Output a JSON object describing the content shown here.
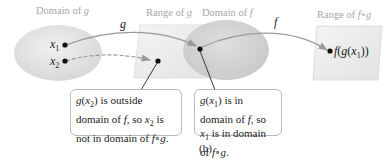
{
  "labels": {
    "domain_g": "Domain of g",
    "range_g": "Range of g",
    "domain_f": "Domain of f",
    "range_fg": "Range of f∘g"
  },
  "functions": {
    "g": "g",
    "f": "f"
  },
  "points": {
    "x1": "x1",
    "x2": "x2",
    "fgx1": "f(g(x1))"
  },
  "callouts": [
    {
      "text": "g(x2) is outside domain of f, so x2 is not in domain of f∘g."
    },
    {
      "text": "g(x1) is in domain of f, so x1 is in domain of f∘g."
    }
  ],
  "caption": "(b)",
  "colors": {
    "ellipse_fill": "#e3e3e3",
    "domain_f_fill": "#d0d0d0",
    "range_fill": "#eeeeee",
    "arrow": "#9a9a9a",
    "label_gray": "#a8a8a8"
  }
}
